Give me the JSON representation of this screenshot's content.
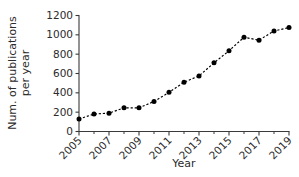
{
  "chart_data": {
    "type": "line",
    "title": "",
    "xlabel": "Year",
    "ylabel": "Num. of publications per year",
    "ylabel_line1": "Num. of publications",
    "ylabel_line2": "per year",
    "x": [
      2005,
      2006,
      2007,
      2008,
      2009,
      2010,
      2011,
      2012,
      2013,
      2014,
      2015,
      2016,
      2017,
      2018,
      2019
    ],
    "values": [
      130,
      180,
      190,
      245,
      245,
      310,
      405,
      510,
      575,
      710,
      835,
      975,
      945,
      1040,
      1075
    ],
    "series": [
      {
        "name": "Num. of publications per year",
        "values": [
          130,
          180,
          190,
          245,
          245,
          310,
          405,
          510,
          575,
          710,
          835,
          975,
          945,
          1040,
          1075
        ]
      }
    ],
    "xlim": [
      2005,
      2019
    ],
    "ylim": [
      0,
      1200
    ],
    "ytick_labels": [
      "0",
      "200",
      "400",
      "600",
      "800",
      "1000",
      "1200"
    ],
    "ytick_values": [
      0,
      200,
      400,
      600,
      800,
      1000,
      1200
    ],
    "xtick_labels": [
      "2005",
      "2007",
      "2009",
      "2011",
      "2013",
      "2015",
      "2017",
      "2019"
    ],
    "xtick_values": [
      2005,
      2007,
      2009,
      2011,
      2013,
      2015,
      2017,
      2019
    ],
    "xtick_minor_values": [
      2006,
      2008,
      2010,
      2012,
      2014,
      2016,
      2018
    ],
    "grid": false,
    "legend": false,
    "legend_position": "none",
    "line_style": "dashed",
    "marker_style": "filled-circle",
    "series_color": "#000000",
    "axis_color": "#3a3a3a",
    "background_color": "#ffffff",
    "xtick_label_rotation": -45
  }
}
